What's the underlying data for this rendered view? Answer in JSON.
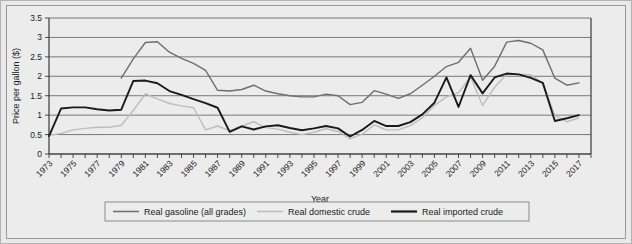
{
  "chart_data": {
    "type": "line",
    "title": "",
    "xlabel": "Year",
    "ylabel": "Price per gallon ($)",
    "ylim": [
      0,
      3.5
    ],
    "ytick_values": [
      0,
      0.5,
      1,
      1.5,
      2,
      2.5,
      3,
      3.5
    ],
    "ytick_labels": [
      "0",
      "0.5",
      "1",
      "1.5",
      "2",
      "2.5",
      "3",
      "3.5"
    ],
    "xlim": [
      1973,
      2018
    ],
    "x": [
      1973,
      1974,
      1975,
      1976,
      1977,
      1978,
      1979,
      1980,
      1981,
      1982,
      1983,
      1984,
      1985,
      1986,
      1987,
      1988,
      1989,
      1990,
      1991,
      1992,
      1993,
      1994,
      1995,
      1996,
      1997,
      1998,
      1999,
      2000,
      2001,
      2002,
      2003,
      2004,
      2005,
      2006,
      2007,
      2008,
      2009,
      2010,
      2011,
      2012,
      2013,
      2014,
      2015,
      2016,
      2017
    ],
    "xtick_labels": [
      "1973",
      "1975",
      "1977",
      "1979",
      "1981",
      "1983",
      "1985",
      "1987",
      "1989",
      "1991",
      "1993",
      "1995",
      "1997",
      "1999",
      "2001",
      "2003",
      "2005",
      "2007",
      "2009",
      "2011",
      "2013",
      "2015",
      "2017"
    ],
    "grid": true,
    "legend_position": "bottom",
    "series": [
      {
        "name": "Real gasoline (all grades)",
        "color": "#6e6e6e",
        "width": 1.4,
        "x_start": 1979,
        "values": [
          null,
          null,
          null,
          null,
          null,
          null,
          1.95,
          2.45,
          2.87,
          2.89,
          2.62,
          2.46,
          2.33,
          2.15,
          1.64,
          1.62,
          1.66,
          1.77,
          1.62,
          1.55,
          1.5,
          1.47,
          1.47,
          1.54,
          1.5,
          1.27,
          1.33,
          1.63,
          1.54,
          1.43,
          1.55,
          1.77,
          2.0,
          2.25,
          2.36,
          2.72,
          1.9,
          2.26,
          2.88,
          2.92,
          2.85,
          2.68,
          1.95,
          1.77,
          1.83
        ]
      },
      {
        "name": "Real domestic crude",
        "color": "#bdbdbd",
        "width": 1.4,
        "x_start": 1973,
        "values": [
          0.48,
          0.53,
          0.62,
          0.66,
          0.69,
          0.69,
          0.74,
          1.12,
          1.55,
          1.42,
          1.3,
          1.24,
          1.19,
          0.62,
          0.72,
          0.6,
          0.72,
          0.83,
          0.68,
          0.64,
          0.56,
          0.5,
          0.56,
          0.65,
          0.58,
          0.39,
          0.51,
          0.75,
          0.62,
          0.62,
          0.73,
          0.93,
          1.25,
          1.47,
          1.58,
          1.98,
          1.25,
          1.72,
          2.05,
          2.05,
          2.04,
          1.82,
          0.99,
          0.83,
          0.93
        ]
      },
      {
        "name": "Real imported crude",
        "color": "#1a1a1a",
        "width": 1.9,
        "x_start": 1973,
        "values": [
          0.46,
          1.17,
          1.2,
          1.2,
          1.15,
          1.12,
          1.14,
          1.88,
          1.89,
          1.82,
          1.62,
          1.52,
          1.41,
          1.31,
          1.19,
          0.57,
          0.71,
          0.63,
          0.71,
          0.74,
          0.67,
          0.61,
          0.66,
          0.72,
          0.66,
          0.45,
          0.62,
          0.85,
          0.72,
          0.72,
          0.82,
          1.02,
          1.32,
          1.97,
          1.21,
          2.03,
          1.56,
          1.97,
          2.07,
          2.05,
          1.96,
          1.83,
          0.85,
          0.92,
          1.0
        ]
      }
    ]
  },
  "legend": {
    "items": [
      {
        "label": "Real gasoline (all grades)",
        "color": "#6e6e6e",
        "width": 1.5
      },
      {
        "label": "Real domestic crude",
        "color": "#bdbdbd",
        "width": 1.5
      },
      {
        "label": "Real imported crude",
        "color": "#1a1a1a",
        "width": 2.2
      }
    ]
  }
}
